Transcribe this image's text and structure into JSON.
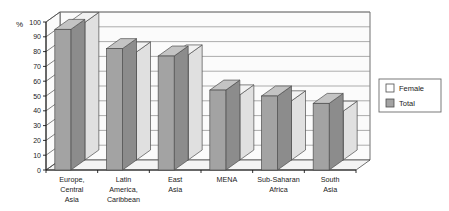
{
  "chart_data": {
    "type": "bar",
    "title": "",
    "subtitle": "",
    "xlabel": "",
    "ylabel": "%",
    "ylim": [
      0,
      100
    ],
    "yticks": [
      0,
      10,
      20,
      30,
      40,
      50,
      60,
      70,
      80,
      90,
      100
    ],
    "ytick_labels": [
      "0",
      "10",
      "20",
      "30",
      "40",
      "50",
      "60",
      "70",
      "80",
      "90",
      "100"
    ],
    "grid": true,
    "grid_axis": "y",
    "legend_position": "right",
    "three_d": true,
    "categories": [
      "Europe, Central Asia",
      "Latin America, Caribbean",
      "East Asia",
      "MENA",
      "Sub-Saharan Africa",
      "South Asia"
    ],
    "category_lines": [
      [
        "Europe,",
        "Central",
        "Asia"
      ],
      [
        "Latin",
        "America,",
        "Caribbean"
      ],
      [
        "East",
        "Asia"
      ],
      [
        "MENA"
      ],
      [
        "Sub-Saharan",
        "Africa"
      ],
      [
        "South",
        "Asia"
      ]
    ],
    "series": [
      {
        "name": "Female",
        "color": "#ffffff",
        "values": [
          93,
          73,
          71,
          44,
          40,
          33
        ]
      },
      {
        "name": "Total",
        "color": "#a3a3a3",
        "values": [
          95,
          82,
          77,
          54,
          50,
          45
        ]
      }
    ]
  },
  "legend": {
    "items": [
      {
        "label": "Female",
        "swatch": "#ffffff"
      },
      {
        "label": "Total",
        "swatch": "#a3a3a3"
      }
    ]
  },
  "colors": {
    "total_front": "#a3a3a3",
    "total_top": "#c4c4c4",
    "total_side": "#8c8c8c",
    "female_front": "#ffffff",
    "female_top": "#f2f2f2",
    "female_side": "#e0e0e0",
    "wall": "#fbfbfb",
    "floor": "#f4f4f4",
    "outline": "#4d4d4d",
    "gridline": "#8a8a8a",
    "text": "#1a1a1a"
  }
}
